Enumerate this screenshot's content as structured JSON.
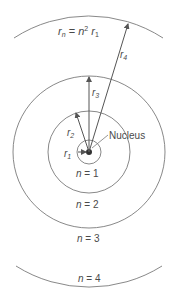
{
  "diagram": {
    "type": "bohr-model-orbits",
    "colors": {
      "line": "#7a7a7a",
      "text": "#4a4a4a",
      "nucleus": "#333333",
      "background": "#ffffff"
    },
    "formula": {
      "lhs_var": "r",
      "lhs_sub": "n",
      "eq": " = ",
      "n": "n",
      "exp": "2",
      "rhs_var": "r",
      "rhs_sub": "1"
    },
    "nucleus_label": "Nucleus",
    "radius_labels": [
      {
        "var": "r",
        "sub": "1"
      },
      {
        "var": "r",
        "sub": "2"
      },
      {
        "var": "r",
        "sub": "3"
      },
      {
        "var": "r",
        "sub": "4"
      }
    ],
    "orbit_labels": [
      {
        "n": "n",
        "eq": " = 1"
      },
      {
        "n": "n",
        "eq": " = 2"
      },
      {
        "n": "n",
        "eq": " = 3"
      },
      {
        "n": "n",
        "eq": " = 4"
      }
    ]
  }
}
